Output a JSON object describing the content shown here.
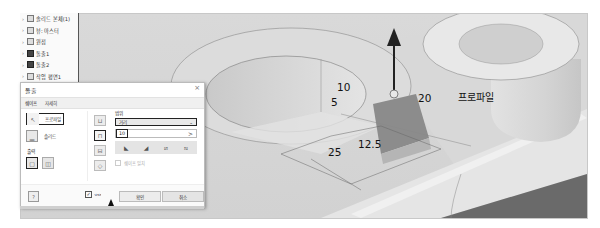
{
  "browser": {
    "items": [
      {
        "label": "솔리드 본체(1)",
        "icon": "solid-bodies-icon"
      },
      {
        "label": "뷰: 마스터",
        "icon": "view-icon"
      },
      {
        "label": "원점",
        "icon": "origin-folder-icon"
      },
      {
        "label": "돌출1",
        "icon": "extrude-feature-icon"
      },
      {
        "label": "돌출2",
        "icon": "extrude-feature-icon"
      },
      {
        "label": "작업 평면1",
        "icon": "work-plane-icon"
      }
    ]
  },
  "dialog": {
    "title": "돌출",
    "close_glyph": "×",
    "tabs": [
      {
        "label": "쉐이프",
        "active": true
      },
      {
        "label": "자세히",
        "active": false
      }
    ],
    "profile_label": "프로파일",
    "solid_label": "솔리드",
    "output_label": "출력",
    "extents_label": "범위",
    "extents_type": "거리",
    "distance_value": "10",
    "distance_arrow": ">",
    "match_shape_label": "쉐이프 일치",
    "preview_checked": true,
    "ok_label": "확인",
    "cancel_label": "취소"
  },
  "viewport": {
    "dimensions": [
      {
        "value": "5"
      },
      {
        "value": "10"
      },
      {
        "value": "20"
      },
      {
        "value": "25"
      },
      {
        "value": "12.5"
      }
    ],
    "profile_tag": "프로파일"
  }
}
